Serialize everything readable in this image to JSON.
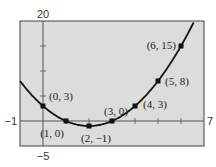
{
  "chart_data": {
    "type": "line",
    "title": "",
    "xlabel": "",
    "ylabel": "",
    "xlim": [
      -1,
      7
    ],
    "ylim": [
      -5,
      20
    ],
    "grid": false,
    "axis_labels": {
      "xmin": "−1",
      "xmax": "7",
      "ymin": "−5",
      "ymax": "20"
    },
    "x_ticks": [
      1,
      2,
      3,
      4,
      5,
      6
    ],
    "y_ticks": [
      5,
      10,
      15
    ],
    "function": "y = x^2 - 4x + 3",
    "series": [
      {
        "name": "parabola",
        "points": [
          {
            "x": 0,
            "y": 3,
            "label": "(0, 3)"
          },
          {
            "x": 1,
            "y": 0,
            "label": "(1, 0)"
          },
          {
            "x": 2,
            "y": -1,
            "label": "(2, −1)"
          },
          {
            "x": 3,
            "y": 0,
            "label": "(3, 0)"
          },
          {
            "x": 4,
            "y": 3,
            "label": "(4, 3)"
          },
          {
            "x": 5,
            "y": 8,
            "label": "(5, 8)"
          },
          {
            "x": 6,
            "y": 15,
            "label": "(6, 15)"
          }
        ]
      }
    ],
    "colors": {
      "background": "#dcdcdc",
      "curve": "#111111",
      "axes": "#555555",
      "frame": "#444444"
    }
  }
}
